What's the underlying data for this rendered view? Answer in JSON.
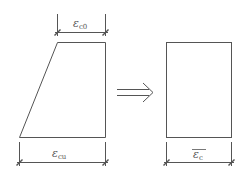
{
  "diagram": {
    "stroke_color": "#555555",
    "left_shape": {
      "type": "trapezoid",
      "top_dimension": {
        "symbol": "ε",
        "subscript": "c0"
      },
      "bottom_dimension": {
        "symbol": "ε",
        "subscript": "cu"
      }
    },
    "arrow": {
      "type": "double-line-arrow",
      "direction": "right"
    },
    "right_shape": {
      "type": "rectangle",
      "bottom_dimension": {
        "symbol": "ε",
        "subscript": "c",
        "overline": true
      }
    }
  }
}
